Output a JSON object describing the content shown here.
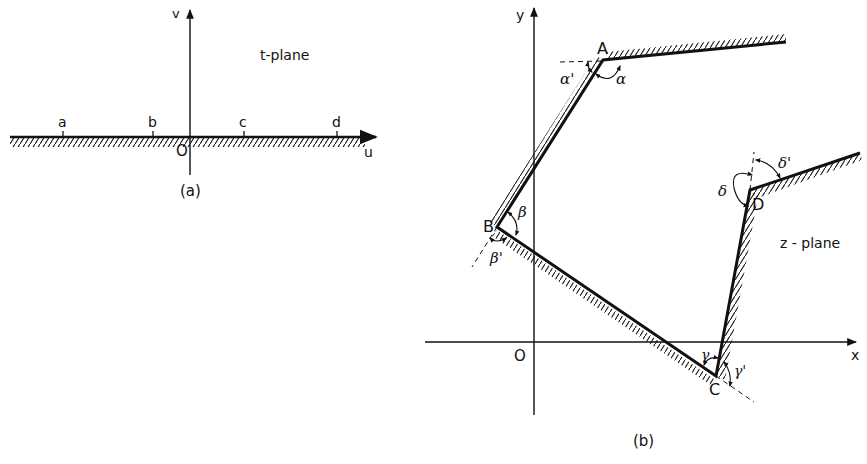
{
  "panel_a": {
    "caption": "(a)",
    "plane_label": "t-plane",
    "axis_h_label": "u",
    "axis_v_label": "v",
    "origin_label": "O",
    "points": [
      {
        "label": "a",
        "x": 63
      },
      {
        "label": "b",
        "x": 153
      },
      {
        "label": "c",
        "x": 244
      },
      {
        "label": "d",
        "x": 337
      }
    ]
  },
  "panel_b": {
    "caption": "(b)",
    "plane_label": "z - plane",
    "axis_h_label": "x",
    "axis_v_label": "y",
    "origin_label": "O",
    "vertices": [
      {
        "label": "A",
        "angle": "α",
        "exterior_angle": "α'"
      },
      {
        "label": "B",
        "angle": "β",
        "exterior_angle": "β'"
      },
      {
        "label": "C",
        "angle": "γ",
        "exterior_angle": "γ'"
      },
      {
        "label": "D",
        "angle": "δ",
        "exterior_angle": "δ'"
      }
    ]
  },
  "colors": {
    "ink": "#111111",
    "background": "#ffffff"
  }
}
